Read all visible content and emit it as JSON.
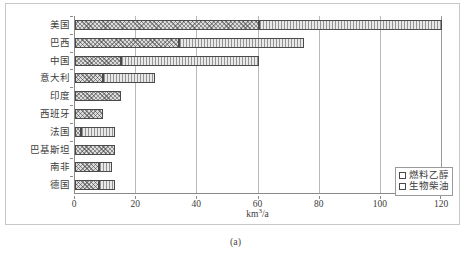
{
  "caption": "(a)",
  "axis": {
    "xlabel_text": "km",
    "xlabel_sup": "3",
    "xlabel_tail": "/a",
    "xticks": [
      0,
      20,
      40,
      60,
      80,
      100,
      120
    ],
    "xlim": [
      0,
      120
    ],
    "grid": true
  },
  "legend": {
    "position": "bottom-right",
    "items": [
      {
        "label": "燃料乙醇",
        "pattern": "ethanol"
      },
      {
        "label": "生物柴油",
        "pattern": "biodiesel"
      }
    ]
  },
  "chart_data": {
    "type": "bar",
    "orientation": "horizontal",
    "stacked": true,
    "title": "",
    "xlabel": "km3/a",
    "ylabel": "",
    "xlim": [
      0,
      120
    ],
    "xticks": [
      0,
      20,
      40,
      60,
      80,
      100,
      120
    ],
    "grid": true,
    "legend_position": "bottom-right",
    "categories": [
      "美国",
      "巴西",
      "中国",
      "意大利",
      "印度",
      "西班牙",
      "法国",
      "巴基斯坦",
      "南非",
      "德国"
    ],
    "series": [
      {
        "name": "燃料乙醇",
        "values": [
          60,
          34,
          15,
          9,
          15,
          9,
          2,
          13,
          8,
          8
        ]
      },
      {
        "name": "生物柴油",
        "values": [
          60,
          41,
          45,
          17,
          0,
          0,
          11,
          0,
          4,
          5
        ]
      }
    ],
    "totals": [
      120,
      75,
      60,
      26,
      15,
      9,
      13,
      13,
      12,
      13
    ]
  }
}
